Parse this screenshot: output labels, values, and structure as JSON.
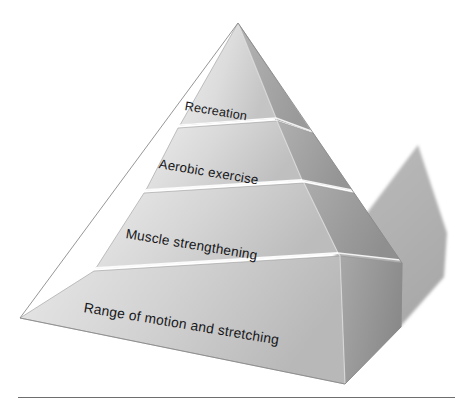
{
  "diagram": {
    "type": "pyramid",
    "orientation": "3d-isometric",
    "tier_count": 4,
    "tiers": [
      {
        "index": 1,
        "position": "top",
        "label": "Recreation",
        "face_color": "#d2d2d2"
      },
      {
        "index": 2,
        "position": "upper-middle",
        "label": "Aerobic exercise",
        "face_color": "#cfcfcf"
      },
      {
        "index": 3,
        "position": "lower-middle",
        "label": "Muscle strengthening",
        "face_color": "#cbcbcb"
      },
      {
        "index": 4,
        "position": "base",
        "label": "Range of motion and stretching",
        "face_color": "#c7c7c7"
      }
    ]
  },
  "colors": {
    "background": "#ffffff",
    "front_face_light": "#e2e2e2",
    "front_face_dark": "#bfbfbf",
    "right_face_light": "#a8a8a8",
    "right_face_dark": "#8f8f8f",
    "shadow": "#b2b2b2",
    "seam": "#fafafa",
    "outline": "#8a8a8a",
    "text": "#17171a",
    "rule": "#6e6e6e"
  },
  "footer": {
    "rule_present": true
  }
}
